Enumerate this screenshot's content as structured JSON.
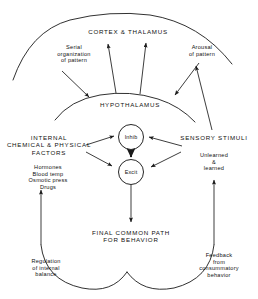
{
  "figure": {
    "title_cortex": "CORTEX & THALAMUS",
    "title_hypothalamus": "HYPOTHALAMUS",
    "node_inhib": "Inhib",
    "node_excit": "Excit",
    "label_internal": "INTERNAL\nCHEMICAL & PHYSICAL\nFACTORS",
    "label_internal_examples": "Hormones\nBlood temp\nOsmotic press\nDrugs",
    "label_sensory": "SENSORY STIMULI",
    "label_sensory_examples": "Unlearned\n&\nlearned",
    "label_serial": "Serial\norganization\nof pattern",
    "label_arousal": "Arousal\nof pattern",
    "label_final_path": "FINAL COMMON PATH\nFOR BEHAVIOR",
    "label_regulation": "Regulation\nof internal\nbalance",
    "label_feedback": "Feedback\nfrom\nconsummatory\nbehavior",
    "footer_partial": "",
    "colors": {
      "ink": "#111111",
      "background": "#ffffff",
      "stroke": "#1a1a1a"
    }
  }
}
